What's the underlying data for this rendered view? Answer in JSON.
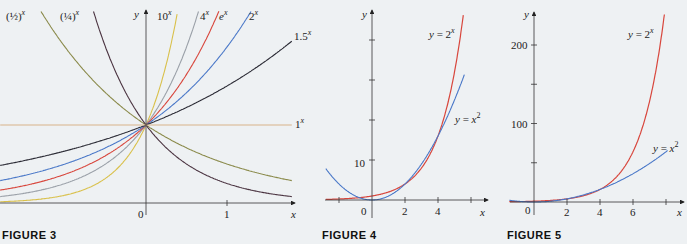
{
  "figures": {
    "fig3": {
      "caption": "FIGURE 3"
    },
    "fig4": {
      "caption": "FIGURE 4"
    },
    "fig5": {
      "caption": "FIGURE 5"
    }
  },
  "chart_data": [
    {
      "type": "line",
      "title": "FIGURE 3",
      "xlabel": "x",
      "ylabel": "y",
      "x_ticks": [
        0,
        1
      ],
      "xlim": [
        -1.8,
        1.8
      ],
      "ylim": [
        0,
        2.5
      ],
      "series": [
        {
          "name": "(1/2)^x",
          "base": 0.5,
          "color": "#8a8a4a"
        },
        {
          "name": "(1/4)^x",
          "base": 0.25,
          "color": "#4a3340"
        },
        {
          "name": "10^x",
          "base": 10,
          "color": "#d9c04a"
        },
        {
          "name": "4^x",
          "base": 4,
          "color": "#9aa0a8"
        },
        {
          "name": "e^x",
          "base": 2.718,
          "color": "#d8463c"
        },
        {
          "name": "2^x",
          "base": 2,
          "color": "#4a78c8"
        },
        {
          "name": "1.5^x",
          "base": 1.5,
          "color": "#2a2a34"
        },
        {
          "name": "1^x",
          "base": 1,
          "color": "#d8b48a"
        }
      ],
      "labels": {
        "half": "(½)",
        "quarter": "(¼)",
        "ten": "10",
        "four": "4",
        "e": "e",
        "two": "2",
        "onefive": "1.5",
        "one": "1",
        "exp": "x"
      }
    },
    {
      "type": "line",
      "title": "FIGURE 4",
      "xlabel": "x",
      "ylabel": "y",
      "x_ticks": [
        -2,
        0,
        2,
        4,
        6
      ],
      "x_tick_labels": [
        "0",
        "2",
        "4"
      ],
      "y_ticks": [
        10,
        20,
        30,
        40
      ],
      "y_tick_labels": [
        "10"
      ],
      "xlim": [
        -2.2,
        6.8
      ],
      "ylim": [
        -1,
        45
      ],
      "series": [
        {
          "name": "y = 2^x",
          "color": "#d8463c"
        },
        {
          "name": "y = x^2",
          "color": "#4a78c8"
        }
      ],
      "annotations": [
        "y = 2^x",
        "y = x^2"
      ],
      "intersections": [
        [
          -0.77,
          0.59
        ],
        [
          2,
          4
        ],
        [
          4,
          16
        ]
      ]
    },
    {
      "type": "line",
      "title": "FIGURE 5",
      "xlabel": "x",
      "ylabel": "y",
      "x_ticks": [
        2,
        4,
        6,
        8
      ],
      "x_tick_labels": [
        "0",
        "2",
        "4",
        "6"
      ],
      "y_ticks": [
        50,
        100,
        150,
        200
      ],
      "y_tick_labels": [
        "100",
        "200"
      ],
      "xlim": [
        -1.5,
        8.5
      ],
      "ylim": [
        0,
        250
      ],
      "series": [
        {
          "name": "y = 2^x",
          "color": "#d8463c"
        },
        {
          "name": "y = x^2",
          "color": "#4a78c8"
        }
      ],
      "annotations": [
        "y = 2^x",
        "y = x^2"
      ]
    }
  ],
  "axis_labels": {
    "x": "x",
    "y": "y"
  },
  "fig4_labels": {
    "ten": "10",
    "zero": "0",
    "two": "2",
    "four": "4",
    "exp_label": "y = 2",
    "pow_label": "y = x"
  },
  "fig5_labels": {
    "h100": "100",
    "h200": "200",
    "zero": "0",
    "two": "2",
    "four": "4",
    "six": "6",
    "exp_label": "y = 2",
    "pow_label": "y = x"
  }
}
